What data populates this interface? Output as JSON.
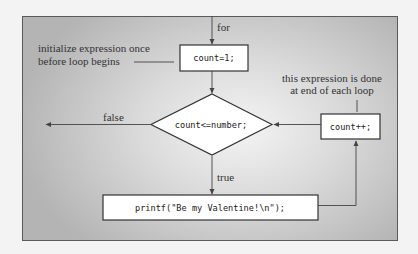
{
  "diagram": {
    "nodes": {
      "init": {
        "label": "count=1;",
        "shape": "rectangle"
      },
      "condition": {
        "label": "count<=number;",
        "shape": "diamond"
      },
      "body": {
        "label": "printf(\"Be my Valentine!\\n\");",
        "shape": "rectangle"
      },
      "update": {
        "label": "count++;",
        "shape": "rectangle"
      }
    },
    "edge_labels": {
      "entry": "for",
      "false": "false",
      "true": "true"
    },
    "annotations": {
      "init_line1": "initialize expression once",
      "init_line2": "before loop begins",
      "update_line1": "this expression is done",
      "update_line2": "at end of each loop"
    },
    "colors": {
      "line": "#444444",
      "box_fill": "#ffffff",
      "frame_border": "#5a5a5a"
    }
  }
}
